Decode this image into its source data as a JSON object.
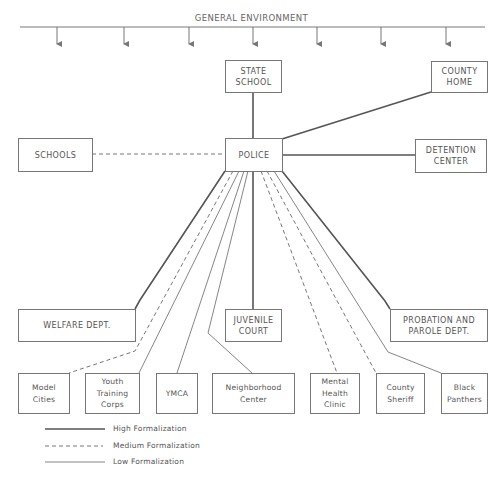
{
  "title": "GENERAL ENVIRONMENT",
  "nodes": {
    "state_school": "STATE\nSCHOOL",
    "county_home": "COUNTY\nHOME",
    "schools": "SCHOOLS",
    "police": "POLICE",
    "detention_center": "DETENTION\nCENTER",
    "welfare": "WELFARE DEPT.",
    "juvenile_court": "JUVENILE\nCOURT",
    "probation": "PROBATION AND\nPAROLE DEPT.",
    "model_cities": "Model\nCities",
    "youth_training": "Youth\nTraining\nCorps",
    "ymca": "YMCA",
    "neighborhood": "Neighborhood\nCenter",
    "mental_health": "Mental\nHealth\nClinic",
    "county_sheriff": "County\nSheriff",
    "black_panthers": "Black\nPanthers"
  },
  "edges": [
    {
      "from": "police",
      "to": "state_school",
      "formalization": "High"
    },
    {
      "from": "police",
      "to": "county_home",
      "formalization": "High"
    },
    {
      "from": "police",
      "to": "schools",
      "formalization": "Medium"
    },
    {
      "from": "police",
      "to": "detention_center",
      "formalization": "High"
    },
    {
      "from": "police",
      "to": "welfare",
      "formalization": "High"
    },
    {
      "from": "police",
      "to": "juvenile_court",
      "formalization": "High"
    },
    {
      "from": "police",
      "to": "probation",
      "formalization": "High"
    },
    {
      "from": "police",
      "to": "model_cities",
      "formalization": "Medium"
    },
    {
      "from": "police",
      "to": "youth_training",
      "formalization": "Low"
    },
    {
      "from": "police",
      "to": "ymca",
      "formalization": "Low"
    },
    {
      "from": "police",
      "to": "neighborhood",
      "formalization": "Low"
    },
    {
      "from": "police",
      "to": "mental_health",
      "formalization": "Medium"
    },
    {
      "from": "police",
      "to": "county_sheriff",
      "formalization": "Medium"
    },
    {
      "from": "police",
      "to": "black_panthers",
      "formalization": "Low"
    }
  ],
  "legend": {
    "high": "High Formalization",
    "medium": "Medium Formalization",
    "low": "Low Formalization"
  },
  "colors": {
    "line": "#555555",
    "box_border": "#777777",
    "text": "#555555"
  }
}
